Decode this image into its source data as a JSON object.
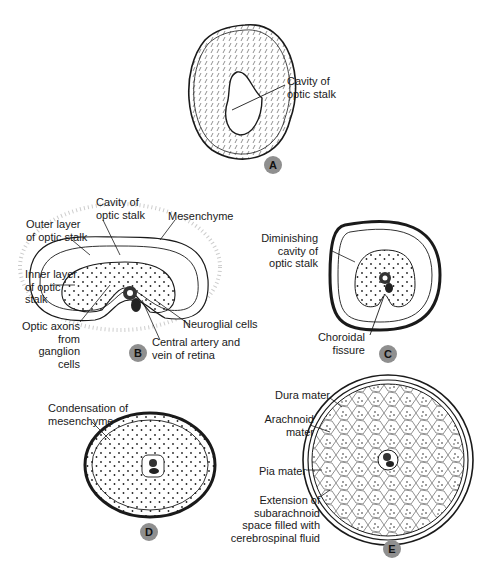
{
  "figure": {
    "panels": [
      {
        "id": "A",
        "badge": "A",
        "labels": {
          "cavity": "Cavity of\noptic stalk"
        }
      },
      {
        "id": "B",
        "badge": "B",
        "labels": {
          "cavity": "Cavity of\noptic stalk",
          "mesenchyme": "Mesenchyme",
          "outer_layer": "Outer layer\nof optic stalk",
          "inner_layer": "Inner layer\nof optic\nstalk",
          "optic_axons": "Optic axons\nfrom\nganglion\ncells",
          "neuroglial": "Neuroglial cells",
          "central_artery": "Central artery and\nvein of retina"
        }
      },
      {
        "id": "C",
        "badge": "C",
        "labels": {
          "diminishing": "Diminishing\ncavity of\noptic stalk",
          "choroidal": "Choroidal\nfissure"
        }
      },
      {
        "id": "D",
        "badge": "D",
        "labels": {
          "condensation": "Condensation of\nmesenchyme"
        }
      },
      {
        "id": "E",
        "badge": "E",
        "labels": {
          "dura": "Dura mater",
          "arachnoid": "Arachnoid\nmater",
          "pia": "Pia mater",
          "extension": "Extension of\nsubarachnoid\nspace filled with\ncerebrospinal fluid"
        }
      }
    ],
    "colors": {
      "ink": "#1a1a1a",
      "badge": "#8f8f8f",
      "background": "#ffffff"
    }
  }
}
